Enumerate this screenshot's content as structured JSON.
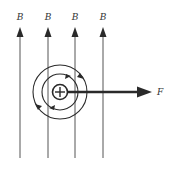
{
  "diagram": {
    "field_label": "B",
    "force_label": "F",
    "field_lines": [
      {
        "label": "B",
        "x": 20
      },
      {
        "label": "B",
        "x": 48
      },
      {
        "label": "B",
        "x": 75
      },
      {
        "label": "B",
        "x": 103
      }
    ],
    "conductor": {
      "symbol": "current-into-page-plus",
      "cx": 60,
      "cy": 92
    },
    "colors": {
      "ink": "#2a2a2a",
      "background": "#ffffff"
    }
  }
}
